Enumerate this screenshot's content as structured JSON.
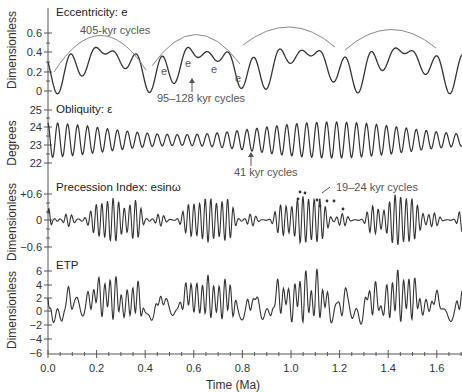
{
  "chart_data": [
    {
      "type": "line",
      "title": "Eccentricity: e",
      "ylabel": "Dimensionless",
      "xlabel": "Time (Ma)",
      "xlim": [
        0.0,
        1.7
      ],
      "ylim": [
        0,
        0.6
      ],
      "yticks": [
        "0",
        "0.2",
        "0.4",
        "0.6"
      ],
      "annotations": [
        "405-kyr cycles",
        "95–128 kyr cycles",
        "e",
        "e",
        "e",
        "e"
      ],
      "series": [
        {
          "name": "eccentricity",
          "x": [
            0.0,
            0.1,
            0.2,
            0.3,
            0.4,
            0.5,
            0.6,
            0.7,
            0.8,
            0.9,
            1.0,
            1.1,
            1.2,
            1.3,
            1.4,
            1.5,
            1.6,
            1.7
          ],
          "values": [
            0.2,
            0.45,
            0.5,
            0.35,
            0.1,
            0.4,
            0.5,
            0.4,
            0.1,
            0.45,
            0.6,
            0.2,
            0.45,
            0.58,
            0.4,
            0.55,
            0.2,
            0.2
          ]
        }
      ]
    },
    {
      "type": "line",
      "title": "Obliquity: ε",
      "ylabel": "Degrees",
      "ylim": [
        22,
        25
      ],
      "yticks": [
        "22",
        "23",
        "24",
        "25"
      ],
      "annotations": [
        "41 kyr cycles"
      ],
      "series": [
        {
          "name": "obliquity",
          "period_kyr": 41,
          "mean": 23.3,
          "amplitude_range": [
            0.4,
            1.1
          ]
        }
      ]
    },
    {
      "type": "line",
      "title": "Precession Index: esinω",
      "ylabel": "Dimensionless",
      "ylim": [
        -0.6,
        0.6
      ],
      "yticks": [
        "−0.6",
        "0",
        "+0.6"
      ],
      "annotations": [
        "19–24 kyr cycles"
      ],
      "series": [
        {
          "name": "precession",
          "period_kyr": [
            19,
            24
          ],
          "amplitude_range": [
            0.05,
            0.5
          ]
        }
      ]
    },
    {
      "type": "line",
      "title": "ETP",
      "ylabel": "Dimensionless",
      "ylim": [
        -6,
        6
      ],
      "yticks": [
        "−6",
        "−4",
        "−2",
        "0",
        "2",
        "4",
        "6"
      ],
      "xticks": [
        "0.0",
        "0.2",
        "0.4",
        "0.6",
        "0.8",
        "1.0",
        "1.2",
        "1.4",
        "1.6"
      ],
      "series": [
        {
          "name": "ETP",
          "range": [
            -3,
            7
          ]
        }
      ]
    }
  ],
  "labels": {
    "ecc_title": "Eccentricity: e",
    "obl_title": "Obliquity: ε",
    "prec_title": "Precession Index: esinω",
    "etp_title": "ETP",
    "ylabel_dim": "Dimensionless",
    "ylabel_deg": "Degrees",
    "xlabel": "Time (Ma)",
    "ann_405": "405-kyr cycles",
    "ann_95": "95–128 kyr cycles",
    "ann_41": "41 kyr cycles",
    "ann_19": "19–24 kyr cycles",
    "e": "e"
  },
  "ticks": {
    "ecc": [
      "0",
      "0.2",
      "0.4",
      "0.6"
    ],
    "obl": [
      "22",
      "23",
      "24",
      "25"
    ],
    "prec": [
      "−0.6",
      "0",
      "+0.6"
    ],
    "etp": [
      "−6",
      "−4",
      "−2",
      "0",
      "2",
      "4",
      "6"
    ],
    "x": [
      "0.0",
      "0.2",
      "0.4",
      "0.6",
      "0.8",
      "1.0",
      "1.2",
      "1.4",
      "1.6"
    ]
  }
}
